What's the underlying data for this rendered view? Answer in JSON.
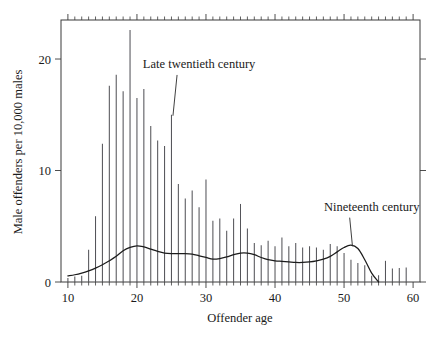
{
  "chart_data": {
    "type": "bar",
    "title": "",
    "xlabel": "Offender age",
    "ylabel": "Male offenders per 10,000 males",
    "xlim": [
      9,
      61
    ],
    "ylim": [
      0,
      23.5
    ],
    "grid": false,
    "legend_position": "inline-annotations",
    "x_ticks_major": [
      10,
      20,
      30,
      40,
      50,
      60
    ],
    "x_tick_labels": [
      "10",
      "20",
      "30",
      "40",
      "50",
      "60"
    ],
    "x_ticks_minor_step": 1,
    "y_ticks_major": [
      0,
      10,
      20
    ],
    "y_tick_labels": [
      "0",
      "10",
      "20"
    ],
    "series": [
      {
        "name": "Late twentieth century",
        "type": "bar",
        "annotation": "Late twentieth century",
        "x": [
          10,
          11,
          12,
          13,
          14,
          15,
          16,
          17,
          18,
          19,
          20,
          21,
          22,
          23,
          24,
          25,
          26,
          27,
          28,
          29,
          30,
          31,
          32,
          33,
          34,
          35,
          36,
          37,
          38,
          39,
          40,
          41,
          42,
          43,
          44,
          45,
          46,
          47,
          48,
          49,
          50,
          51,
          52,
          53,
          54,
          55,
          56,
          57,
          58,
          59
        ],
        "values": [
          0.35,
          0.5,
          0.55,
          2.9,
          5.9,
          12.4,
          17.6,
          18.6,
          17.1,
          22.6,
          16.5,
          17.3,
          14.0,
          12.7,
          12.2,
          15.0,
          8.8,
          7.5,
          8.2,
          6.7,
          9.2,
          5.5,
          5.7,
          4.6,
          5.7,
          7.0,
          4.8,
          3.5,
          3.3,
          3.7,
          3.2,
          4.0,
          3.2,
          3.5,
          3.1,
          3.2,
          3.1,
          2.9,
          3.4,
          3.2,
          2.6,
          2.0,
          1.7,
          1.5,
          0.55,
          0.6,
          1.9,
          1.2,
          1.25,
          1.3
        ]
      },
      {
        "name": "Nineteenth century",
        "type": "line",
        "annotation": "Nineteenth century",
        "x": [
          10,
          11,
          12,
          13,
          14,
          15,
          16,
          17,
          18,
          19,
          20,
          21,
          22,
          23,
          24,
          25,
          26,
          27,
          28,
          29,
          30,
          31,
          32,
          33,
          34,
          35,
          36,
          37,
          38,
          39,
          40,
          41,
          42,
          43,
          44,
          45,
          46,
          47,
          48,
          49,
          50,
          51,
          52,
          53,
          54,
          55
        ],
        "values": [
          0.55,
          0.65,
          0.8,
          1.0,
          1.25,
          1.55,
          1.9,
          2.3,
          2.8,
          3.1,
          3.25,
          3.15,
          2.95,
          2.75,
          2.6,
          2.55,
          2.55,
          2.55,
          2.5,
          2.35,
          2.2,
          2.05,
          2.1,
          2.25,
          2.45,
          2.6,
          2.6,
          2.45,
          2.2,
          2.0,
          1.9,
          1.85,
          1.8,
          1.75,
          1.75,
          1.8,
          1.9,
          2.05,
          2.3,
          2.7,
          3.1,
          3.3,
          3.0,
          2.0,
          0.8,
          0.0
        ]
      }
    ],
    "annotations": [
      {
        "text": "Late twentieth century",
        "target_x": 25,
        "target_y": 15.0,
        "label_x": 29,
        "label_y": 19.2
      },
      {
        "text": "Nineteenth century",
        "target_x": 51,
        "target_y": 3.3,
        "label_x": 54,
        "label_y": 6.4
      }
    ]
  },
  "colors": {
    "background": "#ffffff",
    "frame": "#3a3a3a",
    "bar": "#55555a",
    "curve": "#1c1c1c",
    "text": "#1a1a1a"
  }
}
